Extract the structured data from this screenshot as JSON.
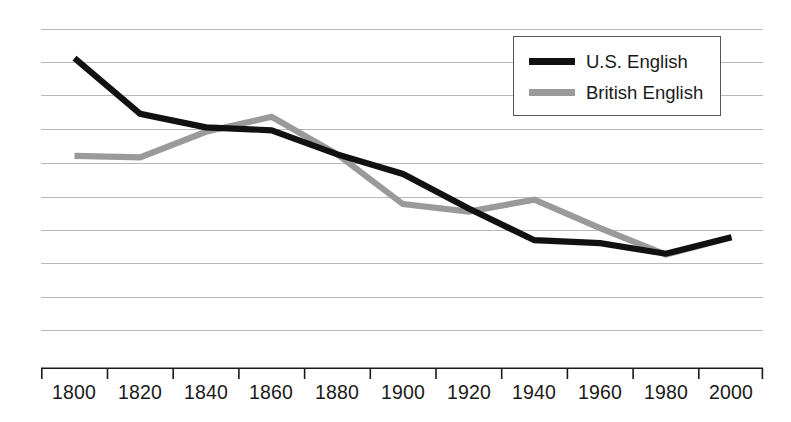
{
  "chart_data": {
    "type": "line",
    "title": "",
    "xlabel": "",
    "ylabel": "",
    "grid": true,
    "gridlines": 10,
    "legend_position": "top-right",
    "x": [
      1800,
      1820,
      1840,
      1860,
      1880,
      1900,
      1920,
      1940,
      1960,
      1980,
      2000
    ],
    "categories": [
      "1800",
      "1820",
      "1840",
      "1860",
      "1880",
      "1900",
      "1920",
      "1940",
      "1960",
      "1980",
      "2000"
    ],
    "xlim": [
      1790,
      2010
    ],
    "ylim": [
      0,
      10
    ],
    "series": [
      {
        "name": "U.S. English",
        "color": "#111111",
        "values": [
          9.05,
          7.2,
          6.75,
          6.65,
          5.85,
          5.2,
          4.05,
          3.0,
          2.9,
          2.55,
          3.1
        ]
      },
      {
        "name": "British English",
        "color": "#9a9a9a",
        "values": [
          5.8,
          5.75,
          6.6,
          7.1,
          5.85,
          4.2,
          3.95,
          4.35,
          3.4,
          2.52,
          3.1
        ]
      }
    ]
  },
  "legend": {
    "items": [
      {
        "label": "U.S. English",
        "swatch": "us"
      },
      {
        "label": "British English",
        "swatch": "uk"
      }
    ]
  },
  "axis": {
    "x_tick_labels": [
      "1800",
      "1820",
      "1840",
      "1860",
      "1880",
      "1900",
      "1920",
      "1940",
      "1960",
      "1980",
      "2000"
    ]
  },
  "colors": {
    "us_english": "#111111",
    "british_english": "#9a9a9a",
    "gridline": "#b9b9b9",
    "axis": "#1a1a1a",
    "background": "#ffffff"
  }
}
